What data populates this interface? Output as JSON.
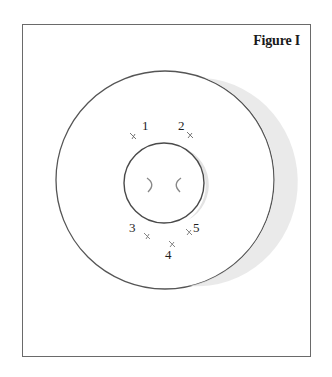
{
  "figure": {
    "title": "Figure I"
  },
  "diagram": {
    "outer_circle": {
      "cx": 165,
      "cy": 180,
      "r": 109,
      "stroke": "#555555"
    },
    "inner_circle": {
      "cx": 164,
      "cy": 183,
      "r": 40,
      "stroke": "#4a4a4a"
    },
    "shadow_color": "#e4e4e4",
    "markers": [
      {
        "id": "1",
        "label": "1",
        "label_x": 142,
        "label_y": 130,
        "x": 133,
        "y": 136
      },
      {
        "id": "2",
        "label": "2",
        "label_x": 178,
        "label_y": 130,
        "x": 190,
        "y": 135
      },
      {
        "id": "3",
        "label": "3",
        "label_x": 129,
        "label_y": 232,
        "x": 147,
        "y": 236
      },
      {
        "id": "4",
        "label": "4",
        "label_x": 165,
        "label_y": 259,
        "x": 172,
        "y": 244
      },
      {
        "id": "5",
        "label": "5",
        "label_x": 193,
        "label_y": 232,
        "x": 189,
        "y": 232
      }
    ],
    "inner_marks": [
      {
        "name": "left-curl",
        "glyph": ")"
      },
      {
        "name": "right-curl",
        "glyph": "("
      }
    ]
  }
}
